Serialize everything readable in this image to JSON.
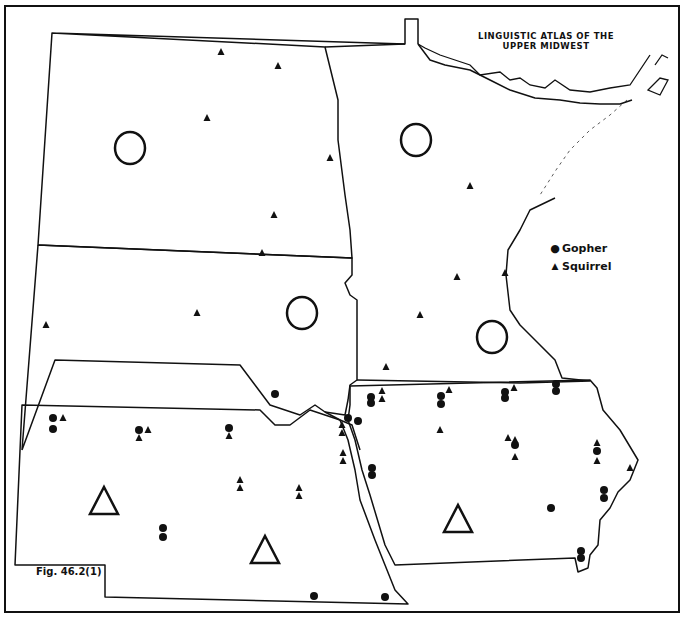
{
  "title": {
    "line1": "LINGUISTIC ATLAS OF THE",
    "line2": "UPPER MIDWEST"
  },
  "figure_label": "Fig. 46.2(1)",
  "legend": [
    {
      "symbol": "circle-filled",
      "label": "Gopher"
    },
    {
      "symbol": "triangle-filled",
      "label": "Squirrel"
    }
  ],
  "map_symbols": {
    "large_open_circles": [
      [
        130,
        148
      ],
      [
        416,
        140
      ],
      [
        302,
        313
      ],
      [
        492,
        337
      ]
    ],
    "large_open_triangles": [
      [
        104,
        502
      ],
      [
        265,
        551
      ],
      [
        458,
        520
      ]
    ],
    "gopher_points": [
      [
        275,
        394
      ],
      [
        53,
        418
      ],
      [
        53,
        429
      ],
      [
        139,
        430
      ],
      [
        229,
        428
      ],
      [
        163,
        528
      ],
      [
        163,
        537
      ],
      [
        371,
        397
      ],
      [
        371,
        403
      ],
      [
        441,
        396
      ],
      [
        441,
        404
      ],
      [
        505,
        392
      ],
      [
        505,
        398
      ],
      [
        556,
        384
      ],
      [
        556,
        391
      ],
      [
        348,
        418
      ],
      [
        358,
        421
      ],
      [
        372,
        468
      ],
      [
        372,
        475
      ],
      [
        515,
        445
      ],
      [
        597,
        451
      ],
      [
        604,
        490
      ],
      [
        604,
        498
      ],
      [
        551,
        508
      ],
      [
        581,
        551
      ],
      [
        581,
        558
      ],
      [
        314,
        596
      ],
      [
        385,
        597
      ]
    ],
    "squirrel_points": [
      [
        221,
        52
      ],
      [
        278,
        66
      ],
      [
        207,
        118
      ],
      [
        330,
        158
      ],
      [
        274,
        215
      ],
      [
        262,
        253
      ],
      [
        46,
        325
      ],
      [
        197,
        313
      ],
      [
        470,
        186
      ],
      [
        457,
        277
      ],
      [
        505,
        273
      ],
      [
        420,
        315
      ],
      [
        386,
        367
      ],
      [
        63,
        418
      ],
      [
        148,
        430
      ],
      [
        139,
        438
      ],
      [
        229,
        436
      ],
      [
        240,
        480
      ],
      [
        240,
        488
      ],
      [
        299,
        488
      ],
      [
        299,
        496
      ],
      [
        382,
        391
      ],
      [
        382,
        399
      ],
      [
        449,
        390
      ],
      [
        514,
        388
      ],
      [
        440,
        430
      ],
      [
        508,
        438
      ],
      [
        515,
        440
      ],
      [
        515,
        457
      ],
      [
        597,
        443
      ],
      [
        597,
        461
      ],
      [
        630,
        468
      ],
      [
        342,
        425
      ],
      [
        342,
        433
      ],
      [
        343,
        453
      ],
      [
        343,
        461
      ]
    ]
  },
  "colors": {
    "ink": "#111111",
    "paper": "#ffffff"
  }
}
